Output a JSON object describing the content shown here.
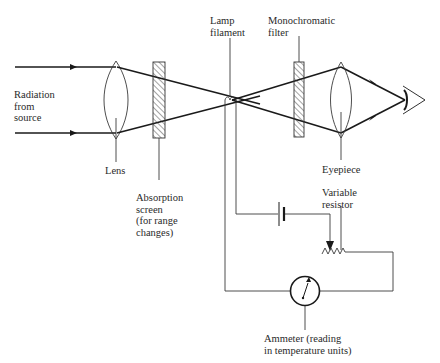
{
  "diagram": {
    "type": "optical pyrometer schematic",
    "colors": {
      "line": "#1a1a1a",
      "thin_line": "#3a3a3a",
      "background": "#ffffff",
      "text": "#2a2a2a"
    },
    "labels": {
      "radiation": "Radiation\nfrom\nsource",
      "lens": "Lens",
      "absorption_screen": "Absorption\nscreen\n(for range\nchanges)",
      "lamp_filament": "Lamp\nfilament",
      "monochromatic_filter": "Monochromatic\nfilter",
      "eyepiece": "Eyepiece",
      "variable_resistor": "Variable\nresistor",
      "ammeter": "Ammeter (reading\nin temperature units)"
    },
    "components": [
      {
        "id": "lens",
        "name": "Lens"
      },
      {
        "id": "absorption-screen",
        "name": "Absorption screen (for range changes)"
      },
      {
        "id": "lamp-filament",
        "name": "Lamp filament"
      },
      {
        "id": "monochromatic-filter",
        "name": "Monochromatic filter"
      },
      {
        "id": "eyepiece",
        "name": "Eyepiece"
      },
      {
        "id": "eye",
        "name": "Observer eye"
      },
      {
        "id": "battery",
        "name": "Battery"
      },
      {
        "id": "variable-resistor",
        "name": "Variable resistor"
      },
      {
        "id": "ammeter",
        "name": "Ammeter (reading in temperature units)"
      }
    ],
    "connections": [
      "Radiation from source -> Lens",
      "Lens -> Absorption screen",
      "Absorption screen -> Lamp filament (focal point)",
      "Lamp filament -> Monochromatic filter",
      "Monochromatic filter -> Eyepiece",
      "Eyepiece -> Eye",
      "Lamp filament -> Battery -> Variable resistor -> Ammeter -> Lamp filament"
    ]
  }
}
